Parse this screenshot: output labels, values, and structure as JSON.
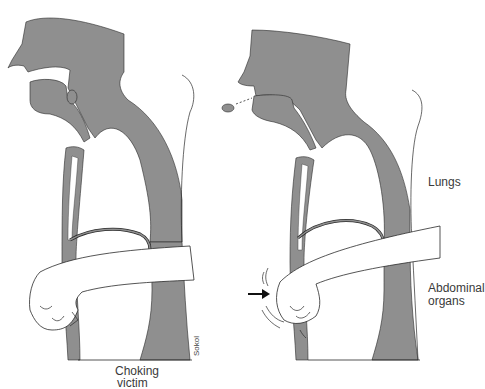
{
  "figure": {
    "panels": [
      {
        "id": "before",
        "caption": "Choking\nvictim",
        "caption_line1": "Choking",
        "caption_line2": "victim"
      },
      {
        "id": "during",
        "labels": [
          "Lungs",
          "Abdominal organs"
        ]
      }
    ],
    "labels": {
      "lungs": "Lungs",
      "abdominal_line1": "Abdominal",
      "abdominal_line2": "organs",
      "victim_line1": "Choking",
      "victim_line2": "victim",
      "artist_signature": "Sokol"
    },
    "colors": {
      "tissue": "#8f8f8f",
      "outline": "#2a2a2a",
      "background": "#ffffff",
      "text": "#3a3a3a"
    },
    "elements": {
      "left_panel": [
        "head-silhouette",
        "airway",
        "food-obstruction",
        "spine",
        "sternum",
        "diaphragm",
        "rescuer-arm",
        "fist"
      ],
      "right_panel": [
        "head-silhouette",
        "airway",
        "expelled-object",
        "spine",
        "sternum",
        "diaphragm",
        "rescuer-arm",
        "fist",
        "thrust-arrow",
        "motion-lines"
      ]
    }
  }
}
